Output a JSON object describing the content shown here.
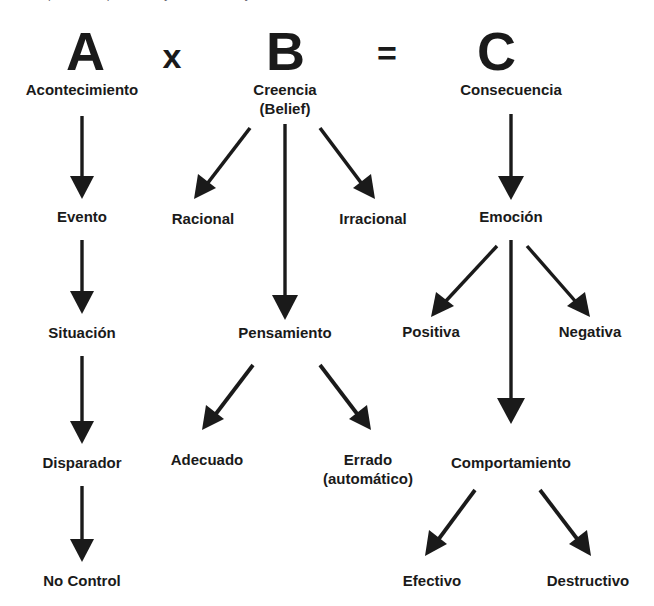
{
  "page": {
    "background_color": "#ffffff",
    "ink_color": "#1a1a1a",
    "cropped_top_text": "puede ser percibido, y tal como es, y es"
  },
  "header": {
    "items": [
      {
        "letter": "A",
        "kind": "letter"
      },
      {
        "letter": "x",
        "kind": "operator"
      },
      {
        "letter": "B",
        "kind": "letter"
      },
      {
        "letter": "=",
        "kind": "operator"
      },
      {
        "letter": "C",
        "kind": "letter"
      }
    ]
  },
  "columns": {
    "a": {
      "letter": "A",
      "root_label": "Acontecimiento",
      "chain": [
        "Evento",
        "Situación",
        "Disparador",
        "No Control"
      ]
    },
    "b": {
      "letter": "B",
      "root_label_line1": "Creencia",
      "root_label_line2": "(Belief)",
      "branch_left_1": "Racional",
      "branch_right_1": "Irracional",
      "middle": "Pensamiento",
      "branch_left_2": "Adecuado",
      "branch_right_2_line1": "Errado",
      "branch_right_2_line2": "(automático)"
    },
    "c": {
      "letter": "C",
      "root_label": "Consecuencia",
      "middle_1": "Emoción",
      "branch_left_1": "Positiva",
      "branch_right_1": "Negativa",
      "middle_2": "Comportamiento",
      "branch_left_2": "Efectivo",
      "branch_right_2": "Destructivo"
    }
  },
  "icons": {
    "arrow_down": "arrow-down-icon",
    "arrow_down_left": "arrow-down-left-icon",
    "arrow_down_right": "arrow-down-right-icon"
  }
}
